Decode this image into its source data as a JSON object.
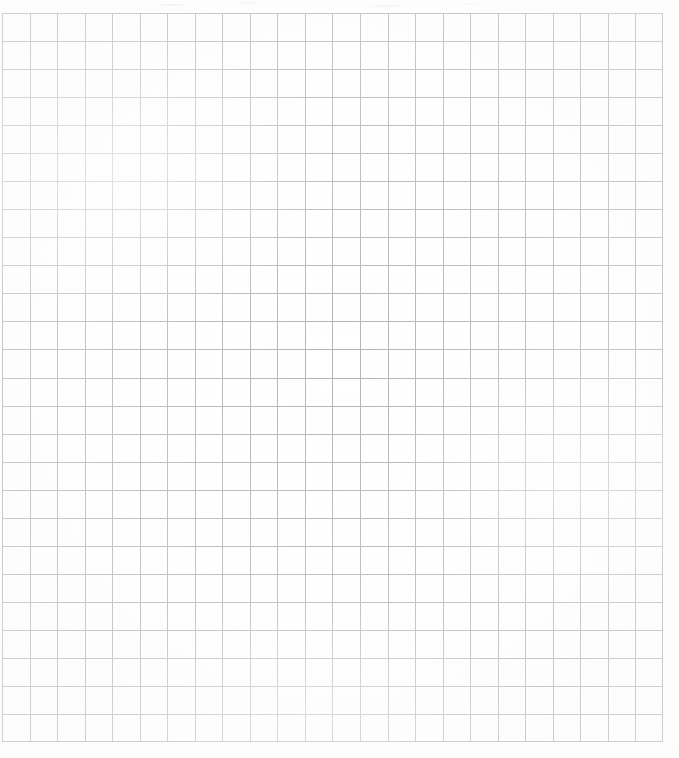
{
  "document": {
    "kind": "scanned-grid-worksheet",
    "title": "Blank grid worksheet",
    "page_background": "#ffffff",
    "content_text": "",
    "has_text": false,
    "has_labels": false,
    "has_figures": false
  },
  "grid": {
    "name": "graph-paper-grid",
    "origin_x": 2,
    "origin_y": 13,
    "width": 661,
    "height": 729,
    "columns": 24,
    "rows": 26,
    "cell_width": 27.54,
    "cell_height": 28.04,
    "line_color": "#b4b4b7",
    "border_color": "#b0b0b4",
    "line_width": 1,
    "uniform_weight": true,
    "major_minor": false
  },
  "margins": {
    "top": 13,
    "left": 2,
    "right": 16,
    "bottom": 16
  },
  "scan": {
    "noise_band_top_height": 13,
    "noise_color": "#96969b"
  }
}
